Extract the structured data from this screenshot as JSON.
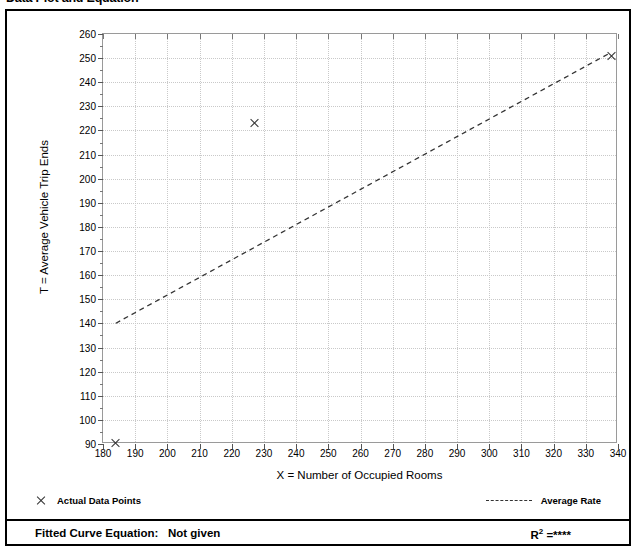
{
  "page": {
    "title": "Data Plot and Equation",
    "title_right": ""
  },
  "chart_data": {
    "type": "scatter",
    "title": "Data Plot and Equation",
    "xlabel": "X = Number of Occupied Rooms",
    "ylabel": "T = Average Vehicle Trip Ends",
    "xlim": [
      180,
      340
    ],
    "ylim": [
      90,
      260
    ],
    "xticks": [
      180,
      190,
      200,
      210,
      220,
      230,
      240,
      250,
      260,
      270,
      280,
      290,
      300,
      310,
      320,
      330,
      340
    ],
    "yticks": [
      90,
      100,
      110,
      120,
      130,
      140,
      150,
      160,
      170,
      180,
      190,
      200,
      210,
      220,
      230,
      240,
      250,
      260
    ],
    "grid": true,
    "legend_position": "below-plot",
    "series": [
      {
        "name": "Actual Data Points",
        "type": "scatter",
        "marker": "x",
        "points": [
          {
            "x": 184,
            "y": 90.5
          },
          {
            "x": 227,
            "y": 223
          },
          {
            "x": 338,
            "y": 251
          }
        ]
      },
      {
        "name": "Average Rate",
        "type": "line",
        "style": "dashed",
        "points": [
          {
            "x": 184,
            "y": 139.5
          },
          {
            "x": 338,
            "y": 252
          }
        ]
      }
    ]
  },
  "legend": {
    "data_points_label": "Actual Data Points",
    "average_rate_label": "Average Rate",
    "data_points_icon": "x-marker-icon",
    "average_rate_icon": "dashed-line-icon"
  },
  "footer": {
    "equation_label": "Fitted Curve Equation:",
    "equation_value": "Not given",
    "r_squared_label": "R",
    "r_squared_exponent": "2",
    "r_squared_equals": "=",
    "r_squared_value": "****"
  },
  "colors": {
    "axis": "#9a9a9a",
    "grid": "#c9c9c9",
    "marker": "#333333",
    "trend": "#333333",
    "border": "#000000"
  }
}
